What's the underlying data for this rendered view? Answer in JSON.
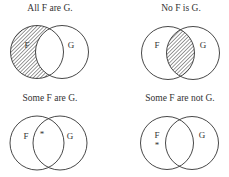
{
  "panels": [
    {
      "caption": "All F are G.",
      "set_f_label": "F",
      "set_g_label": "G",
      "shaded_region": "F only (F minus G)",
      "marker": null
    },
    {
      "caption": "No F is G.",
      "set_f_label": "F",
      "set_g_label": "G",
      "shaded_region": "F and G intersection",
      "marker": null
    },
    {
      "caption": "Some F are G.",
      "set_f_label": "F",
      "set_g_label": "G",
      "shaded_region": null,
      "marker": "*"
    },
    {
      "caption": "Some F are not G.",
      "set_f_label": "F",
      "set_g_label": "G",
      "shaded_region": null,
      "marker": "*"
    }
  ],
  "colors": {
    "stroke": "#333333",
    "background": "#ffffff"
  }
}
